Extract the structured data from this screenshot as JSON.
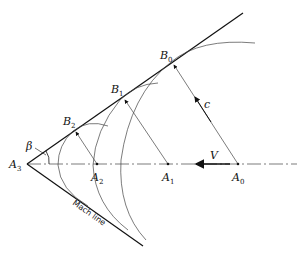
{
  "diagram": {
    "colors": {
      "line": "#111111",
      "thin": "#444444",
      "background": "#ffffff"
    },
    "points": {
      "A0": {
        "label": "A",
        "sub": "0"
      },
      "A1": {
        "label": "A",
        "sub": "1"
      },
      "A2": {
        "label": "A",
        "sub": "2"
      },
      "A3": {
        "label": "A",
        "sub": "3"
      },
      "B0": {
        "label": "B",
        "sub": "0"
      },
      "B1": {
        "label": "B",
        "sub": "1"
      },
      "B2": {
        "label": "B",
        "sub": "2"
      }
    },
    "labels": {
      "velocity": "V",
      "sound_speed": "c",
      "angle": "β",
      "mach_line": "Mach line"
    }
  }
}
